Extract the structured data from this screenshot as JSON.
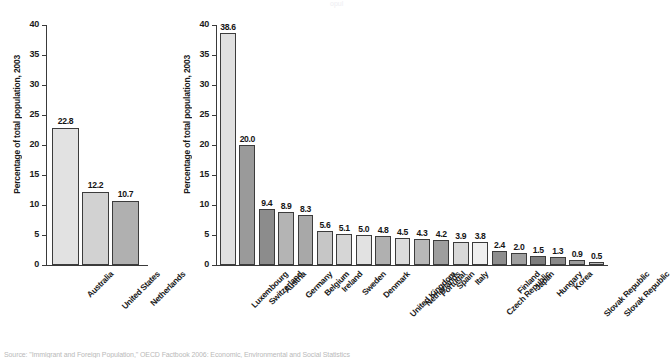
{
  "figure": {
    "source_note": "Source: \"Immigrant and Foreign Population,\" OECD Factbook 2006: Economic, Environmental and Social Statistics",
    "top_fragment": "opul"
  },
  "chart_data": [
    {
      "id": "left",
      "type": "bar",
      "title": "",
      "xlabel": "",
      "ylabel": "Percentage of total population, 2003",
      "ylim": [
        0,
        40
      ],
      "yticks": [
        0,
        5,
        10,
        15,
        20,
        25,
        30,
        35,
        40
      ],
      "grid": false,
      "legend": "none",
      "categories": [
        "Australia",
        "United States",
        "Netherlands"
      ],
      "values": [
        22.8,
        12.2,
        10.7
      ],
      "value_labels": [
        "22.8",
        "12.2",
        "10.7"
      ],
      "bar_colors": [
        "#e2e2e2",
        "#d2d2d2",
        "#b0b0b0"
      ]
    },
    {
      "id": "right",
      "type": "bar",
      "title": "",
      "xlabel": "",
      "ylabel": "Percentage of total population, 2003",
      "ylim": [
        0,
        40
      ],
      "yticks": [
        0,
        5,
        10,
        15,
        20,
        25,
        30,
        35,
        40
      ],
      "grid": false,
      "legend": "none",
      "categories": [
        "Luxembourg",
        "Switzerland",
        "Austria",
        "Germany",
        "Belgium",
        "Ireland",
        "Sweden",
        "Denmark",
        "United Kingdom",
        "Netherlands",
        "Portugal",
        "Spain",
        "Italy",
        "Czech Republic",
        "Finland",
        "Japan",
        "Hungary",
        "Korea",
        "Slovak Republic"
      ],
      "values": [
        38.6,
        20.0,
        9.4,
        8.9,
        8.3,
        5.6,
        5.1,
        5.0,
        4.8,
        4.5,
        4.3,
        4.2,
        3.9,
        3.8,
        2.4,
        2.0,
        1.5,
        1.3,
        0.9
      ],
      "value_labels": [
        "38.6",
        "20.0",
        "9.4",
        "8.9",
        "8.3",
        "5.6",
        "5.1",
        "5.0",
        "4.8",
        "4.5",
        "4.3",
        "4.2",
        "3.9",
        "3.8",
        "2.4",
        "2.0",
        "1.5",
        "1.3",
        "0.9"
      ],
      "bar_colors": [
        "#e0e0e0",
        "#9a9a9a",
        "#8c8c8c",
        "#b4b4b4",
        "#a8a8a8",
        "#c6c6c6",
        "#d6d6d6",
        "#e2e2e2",
        "#b0b0b0",
        "#dcdcdc",
        "#b8b8b8",
        "#9e9e9e",
        "#d8d8d8",
        "#f0f0f0",
        "#8e8e8e",
        "#a0a0a0",
        "#7e7e7e",
        "#8a8a8a",
        "#9c9c9c"
      ],
      "extra_category": "Slovak Republic",
      "extra_value": 0.5,
      "extra_value_label": "0.5"
    }
  ]
}
